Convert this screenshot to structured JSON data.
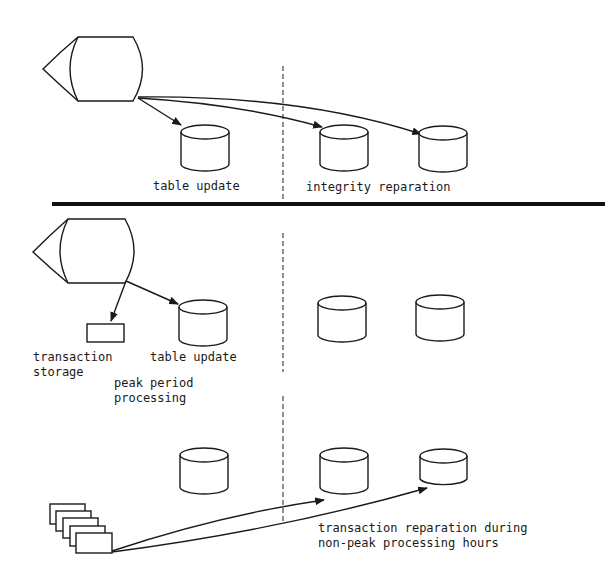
{
  "diagram": {
    "type": "transaction-processing-comparison",
    "sections": [
      {
        "id": "immediate-integrity",
        "labels": {
          "left": "table update",
          "right": "integrity reparation"
        }
      },
      {
        "id": "peak-period",
        "labels": {
          "storage_line1": "transaction",
          "storage_line2": "storage",
          "table": "table update",
          "phase_line1": "peak period",
          "phase_line2": "processing"
        }
      },
      {
        "id": "non-peak",
        "labels": {
          "note_line1": "transaction reparation during",
          "note_line2": "non-peak processing hours"
        }
      }
    ],
    "icons": {
      "terminal": "display-terminal-icon",
      "database": "database-cylinder-icon",
      "storage": "transaction-storage-box-icon",
      "cards": "transaction-cards-stack-icon"
    },
    "colors": {
      "ink": "#1a1a1a",
      "background": "#ffffff"
    }
  }
}
